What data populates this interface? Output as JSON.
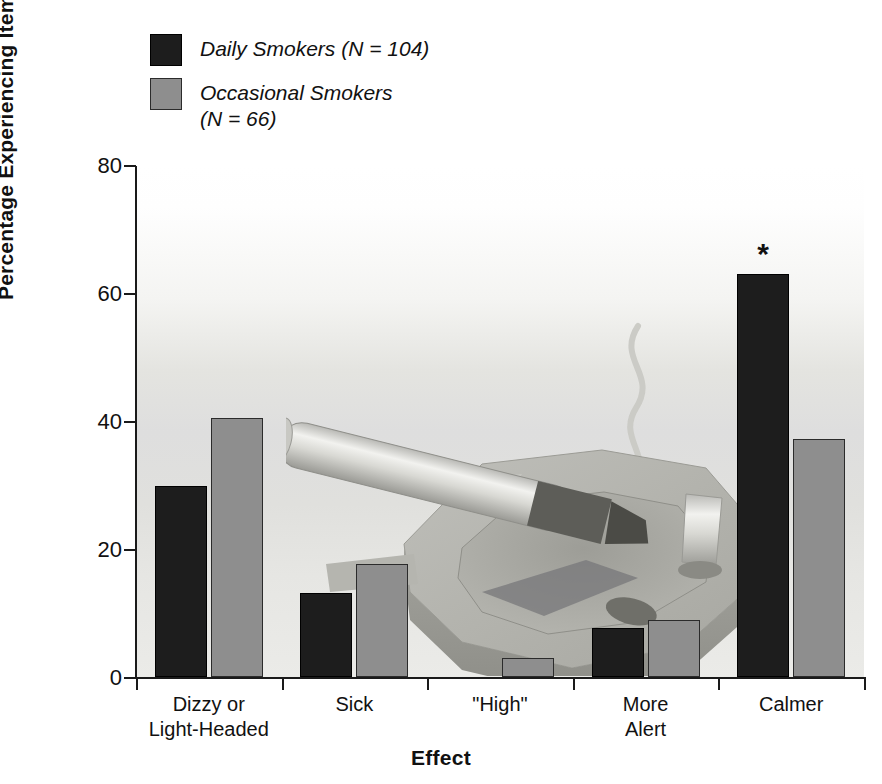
{
  "chart_data": {
    "type": "bar",
    "title": "",
    "xlabel": "Effect",
    "ylabel": "Percentage Experiencing Item",
    "ylim": [
      0,
      80
    ],
    "yticks": [
      0,
      20,
      40,
      60,
      80
    ],
    "grid": false,
    "legend_position": "top-left",
    "categories": [
      "Dizzy or\nLight-Headed",
      "Sick",
      "\"High\"",
      "More\nAlert",
      "Calmer"
    ],
    "series": [
      {
        "name": "Daily Smokers (N = 104)",
        "color": "#1d1d1d",
        "values": [
          29.8,
          13.2,
          0,
          7.7,
          63.0
        ]
      },
      {
        "name": "Occasional Smokers\n(N = 66)",
        "color": "#8e8e8e",
        "values": [
          40.5,
          17.6,
          3.0,
          8.9,
          37.2
        ]
      }
    ],
    "annotations": [
      {
        "text": "*",
        "category": "Calmer",
        "series": "Daily Smokers (N = 104)"
      }
    ]
  },
  "legend": {
    "items": [
      {
        "label": "Daily Smokers (N = 104)",
        "swatch": "daily"
      },
      {
        "label": "Occasional Smokers\n(N = 66)",
        "swatch": "occ"
      }
    ]
  },
  "axis": {
    "y_title": "Percentage Experiencing Item",
    "x_title": "Effect",
    "y_tick_labels": [
      "80",
      "60",
      "40",
      "20",
      "0"
    ]
  },
  "artwork": {
    "name": "ashtray-with-cigarette-illustration"
  }
}
